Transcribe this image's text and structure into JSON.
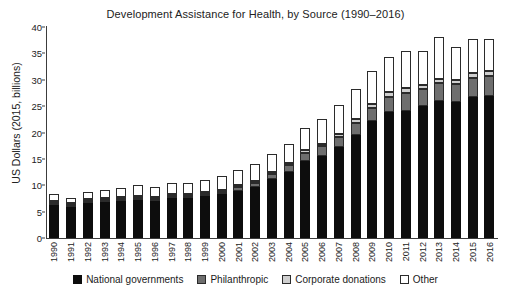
{
  "chart_data": {
    "type": "bar",
    "subtype": "stacked",
    "title": "Development Assistance for Health, by Source (1990–2016)",
    "xlabel": "",
    "ylabel": "US Dollars (2015, billions)",
    "ylim": [
      0,
      40
    ],
    "ytick_step": 5,
    "yticks": [
      0,
      5,
      10,
      15,
      20,
      25,
      30,
      35,
      40
    ],
    "grid": false,
    "legend_position": "bottom",
    "categories": [
      "1990",
      "1991",
      "1992",
      "1993",
      "1994",
      "1995",
      "1996",
      "1997",
      "1998",
      "1999",
      "2000",
      "2001",
      "2002",
      "2003",
      "2004",
      "2005",
      "2006",
      "2007",
      "2008",
      "2009",
      "2010",
      "2011",
      "2012",
      "2013",
      "2014",
      "2015",
      "2016"
    ],
    "series": [
      {
        "name": "National governments",
        "color": "#0d0d0d",
        "values": [
          6.3,
          5.8,
          6.6,
          6.8,
          7.1,
          7.3,
          7.0,
          7.6,
          7.5,
          7.9,
          8.3,
          9.0,
          9.7,
          11.2,
          12.6,
          14.6,
          15.6,
          17.3,
          19.6,
          22.1,
          23.8,
          24.1,
          25.1,
          26.0,
          25.8,
          26.7,
          27.0
        ]
      },
      {
        "name": "Philanthropic",
        "color": "#6e6e6e",
        "values": [
          0.2,
          0.2,
          0.2,
          0.2,
          0.2,
          0.3,
          0.3,
          0.3,
          0.3,
          0.4,
          0.5,
          0.6,
          0.8,
          1.0,
          1.3,
          1.5,
          1.8,
          1.9,
          2.3,
          2.6,
          3.0,
          3.4,
          3.1,
          3.3,
          3.4,
          3.6,
          3.7
        ]
      },
      {
        "name": "Corporate donations",
        "color": "#cfcfcf",
        "values": [
          0.1,
          0.1,
          0.1,
          0.1,
          0.1,
          0.1,
          0.1,
          0.1,
          0.2,
          0.2,
          0.2,
          0.2,
          0.3,
          0.3,
          0.4,
          0.5,
          0.5,
          0.6,
          0.6,
          0.7,
          0.8,
          0.9,
          0.8,
          0.9,
          0.8,
          0.9,
          0.9
        ]
      },
      {
        "name": "Other",
        "color": "#ffffff",
        "values": [
          1.2,
          1.1,
          1.3,
          1.5,
          1.7,
          1.9,
          2.0,
          2.1,
          2.2,
          2.4,
          2.6,
          2.9,
          3.1,
          3.3,
          3.6,
          4.2,
          4.6,
          5.4,
          5.8,
          6.2,
          6.7,
          7.1,
          6.5,
          8.0,
          6.3,
          6.6,
          6.1
        ]
      }
    ],
    "totals": [
      7.8,
      7.2,
      8.2,
      8.6,
      9.1,
      9.6,
      9.4,
      10.1,
      10.2,
      10.9,
      11.6,
      12.7,
      13.9,
      15.8,
      17.9,
      20.8,
      22.5,
      25.2,
      28.3,
      31.6,
      34.3,
      35.5,
      35.5,
      38.2,
      36.3,
      37.8,
      37.7
    ]
  },
  "legend": {
    "items": [
      {
        "label": "National governments",
        "swatch": "legend-swatch-national"
      },
      {
        "label": "Philanthropic",
        "swatch": "legend-swatch-philanthropic"
      },
      {
        "label": "Corporate donations",
        "swatch": "legend-swatch-corporate"
      },
      {
        "label": "Other",
        "swatch": "legend-swatch-other"
      }
    ]
  }
}
